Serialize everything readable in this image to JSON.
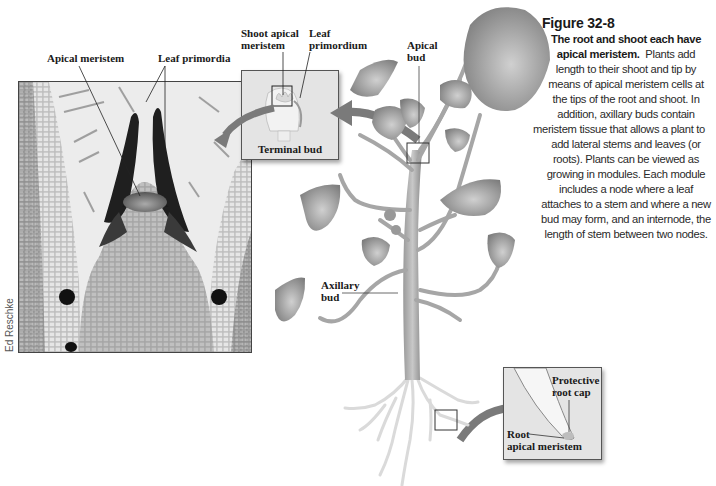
{
  "figure": {
    "number": "Figure 32-8",
    "title": "The root and shoot each have apical meristem.",
    "body": "Plants add length to their shoot and tip by means of apical meristem cells at the tips of the root and shoot. In addition, axillary buds contain meristem tissue that allows a plant to add lateral stems and leaves (or roots). Plants can be viewed as growing in modules. Each module includes a node where a leaf attaches to a stem and where a new bud may form, and an internode, the length of stem between two nodes.",
    "caption_lines": [
      "The root and shoot each have",
      "apical meristem.",
      "Plants add",
      "length to their shoot and tip by",
      "means of apical meristem cells at",
      "the tips of the root and shoot. In",
      "addition, axillary buds contain",
      "meristem tissue that allows a plant to",
      "add lateral stems and leaves (or",
      "roots). Plants can be viewed as",
      "growing in modules. Each module",
      "includes a node where a leaf",
      "attaches to a stem and where a new",
      "bud may form, and an internode, the",
      "length of stem between two nodes."
    ]
  },
  "micrograph": {
    "labels": {
      "apical_meristem": "Apical meristem",
      "leaf_primordia": "Leaf primordia"
    },
    "credit": "Ed Reschke"
  },
  "terminal_bud_inset": {
    "title": "Terminal bud",
    "labels": {
      "shoot_apical_meristem_1": "Shoot apical",
      "shoot_apical_meristem_2": "meristem",
      "leaf_primordium_1": "Leaf",
      "leaf_primordium_2": "primordium"
    }
  },
  "plant": {
    "labels": {
      "apical_bud_1": "Apical",
      "apical_bud_2": "bud",
      "axillary_bud_1": "Axillary",
      "axillary_bud_2": "bud"
    }
  },
  "root_inset": {
    "labels": {
      "protective_root_cap_1": "Protective",
      "protective_root_cap_2": "root cap",
      "root_apical_meristem_1": "Root",
      "root_apical_meristem_2": "apical meristem"
    }
  },
  "colors": {
    "leaf": "#8a8a8a",
    "leaf_light": "#c4c4c4",
    "stem": "#a8a8a8",
    "root": "#dcdcdc",
    "arrow": "#7a7a7a",
    "inset_bg": "#e4e4e4",
    "tissue_dark": "#2a2a2a"
  }
}
